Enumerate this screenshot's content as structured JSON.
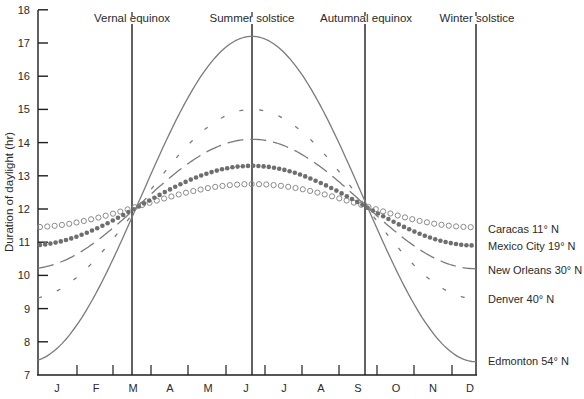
{
  "chart_data": {
    "type": "line",
    "title": "",
    "xlabel": "",
    "ylabel": "Duration of daylight (hr)",
    "ylim": [
      7,
      18
    ],
    "yticks": [
      7,
      8,
      9,
      10,
      11,
      12,
      13,
      14,
      15,
      16,
      17,
      18
    ],
    "categories": [
      "J",
      "F",
      "M",
      "A",
      "M",
      "J",
      "J",
      "A",
      "S",
      "O",
      "N",
      "D"
    ],
    "grid": false,
    "legend_position": "right, inline at line ends",
    "annotations": [
      {
        "label": "Vernal equinox",
        "month_position": 2.7
      },
      {
        "label": "Summer solstice",
        "month_position": 5.7
      },
      {
        "label": "Autumnal equinox",
        "month_position": 8.7
      },
      {
        "label": "Winter solstice",
        "month_position": 11.7
      }
    ],
    "series": [
      {
        "name": "Caracas 11° N",
        "style": "open-circles",
        "peak": 12.75,
        "min": 11.45,
        "values": [
          11.5,
          11.65,
          12.0,
          12.35,
          12.6,
          12.75,
          12.7,
          12.5,
          12.1,
          11.8,
          11.55,
          11.45
        ]
      },
      {
        "name": "Mexico City 19° N",
        "style": "filled-dots",
        "peak": 13.3,
        "min": 10.9,
        "values": [
          11.0,
          11.3,
          11.9,
          12.5,
          13.05,
          13.3,
          13.2,
          12.85,
          12.2,
          11.55,
          11.1,
          10.9
        ]
      },
      {
        "name": "New Orleans 30° N",
        "style": "long-dash",
        "peak": 14.1,
        "min": 10.2,
        "values": [
          10.3,
          10.9,
          11.8,
          12.9,
          13.7,
          14.1,
          13.9,
          13.3,
          12.3,
          11.3,
          10.55,
          10.2
        ]
      },
      {
        "name": "Denver 40° N",
        "style": "short-dash",
        "peak": 15.0,
        "min": 9.3,
        "values": [
          9.4,
          10.2,
          11.6,
          13.0,
          14.3,
          15.0,
          14.7,
          13.8,
          12.4,
          10.9,
          9.8,
          9.3
        ]
      },
      {
        "name": "Edmonton 54° N",
        "style": "solid",
        "peak": 17.2,
        "min": 7.4,
        "values": [
          7.5,
          8.9,
          11.3,
          13.9,
          16.1,
          17.2,
          16.8,
          15.0,
          12.4,
          9.9,
          8.1,
          7.4
        ]
      }
    ]
  },
  "axis": {
    "ylabel": "Duration of daylight (hr)",
    "yticks": [
      "7",
      "8",
      "9",
      "10",
      "11",
      "12",
      "13",
      "14",
      "15",
      "16",
      "17",
      "18"
    ],
    "months": [
      "J",
      "F",
      "M",
      "A",
      "M",
      "J",
      "J",
      "A",
      "S",
      "O",
      "N",
      "D"
    ]
  },
  "events": {
    "vernal": "Vernal equinox",
    "summer": "Summer solstice",
    "autumnal": "Autumnal equinox",
    "winter": "Winter solstice"
  },
  "legend": {
    "caracas": "Caracas 11° N",
    "mexico_city": "Mexico City 19° N",
    "new_orleans": "New Orleans 30° N",
    "denver": "Denver 40° N",
    "edmonton": "Edmonton 54° N"
  },
  "colors": {
    "axis": "#1e1e1e",
    "curve": "#7a7a7a",
    "dots": "#6e6e6e"
  }
}
